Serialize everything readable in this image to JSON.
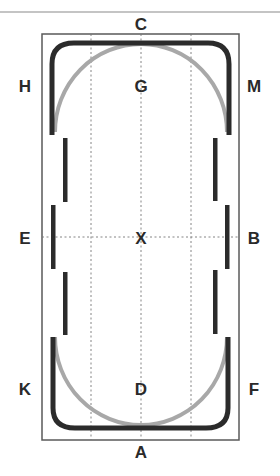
{
  "diagram": {
    "colors": {
      "background": "#ffffff",
      "border": "#5a5a5a",
      "path": "#2b2b2b",
      "circle": "#a8a8a8",
      "guide": "#777777",
      "label": "#2a2a2a"
    },
    "letters": {
      "top": "C",
      "bottom": "A",
      "left_top": "H",
      "left_mid": "E",
      "left_bottom": "K",
      "right_top": "M",
      "right_mid": "B",
      "right_bottom": "F",
      "center_top": "G",
      "center": "X",
      "center_bottom": "D"
    }
  }
}
